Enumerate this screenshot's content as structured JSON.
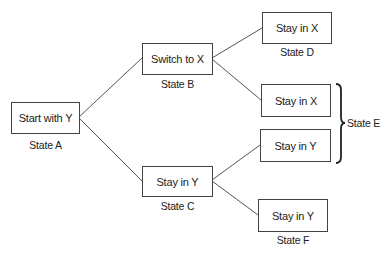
{
  "diagram": {
    "type": "decision-tree",
    "nodes": [
      {
        "id": "A",
        "text": "Start with Y",
        "state": "State A"
      },
      {
        "id": "B",
        "text": "Switch to X",
        "state": "State B"
      },
      {
        "id": "C",
        "text": "Stay in Y",
        "state": "State C"
      },
      {
        "id": "D",
        "text": "Stay in X",
        "state": "State D"
      },
      {
        "id": "E1",
        "text": "Stay in X"
      },
      {
        "id": "E2",
        "text": "Stay in Y"
      },
      {
        "id": "F",
        "text": "Stay in Y",
        "state": "State F"
      }
    ],
    "group_label": "State E",
    "edges": [
      [
        "A",
        "B"
      ],
      [
        "A",
        "C"
      ],
      [
        "B",
        "D"
      ],
      [
        "B",
        "E1"
      ],
      [
        "C",
        "E2"
      ],
      [
        "C",
        "F"
      ]
    ]
  }
}
